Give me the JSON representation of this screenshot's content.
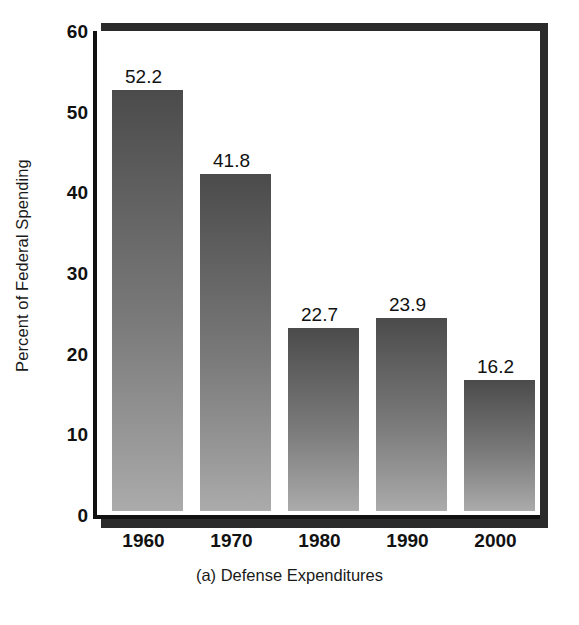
{
  "chart_data": {
    "type": "bar",
    "title": "",
    "caption": "(a) Defense Expenditures",
    "xlabel": "",
    "ylabel": "Percent of Federal Spending",
    "categories": [
      "1960",
      "1970",
      "1980",
      "1990",
      "2000"
    ],
    "values": [
      52.2,
      41.8,
      22.7,
      23.9,
      16.2
    ],
    "value_labels": [
      "52.2",
      "41.8",
      "22.7",
      "23.9",
      "16.2"
    ],
    "ylim": [
      0,
      60
    ],
    "yticks": [
      60,
      50,
      40,
      30,
      20,
      10,
      0
    ],
    "ytick_labels": [
      "60",
      "50",
      "40",
      "30",
      "20",
      "10",
      "0"
    ],
    "grid": false,
    "legend": null,
    "series": [
      {
        "name": "Defense Expenditures",
        "values": [
          52.2,
          41.8,
          22.7,
          23.9,
          16.2
        ]
      }
    ],
    "colors": {
      "bar_top": "#4b4b4b",
      "bar_bottom": "#ababab",
      "axis": "#111111",
      "shadow": "#2b2b2b",
      "text": "#111111",
      "background": "#ffffff"
    }
  }
}
